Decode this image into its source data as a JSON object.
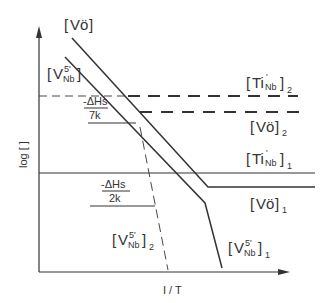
{
  "diagram": {
    "title": "",
    "axes": {
      "x_label": "I / T",
      "y_label": "log [ ]"
    },
    "curves": [
      {
        "id": "vo",
        "label": "[Vö]",
        "position": "top",
        "style": "solid"
      },
      {
        "id": "vnb5",
        "label": "[V5'Nb]",
        "position": "top-left",
        "style": "solid"
      },
      {
        "id": "tinb2",
        "label": "[Ti'Nb]2",
        "style": "dashed-thick"
      },
      {
        "id": "vo2",
        "label": "[Vö]2",
        "style": "dashed-thick"
      },
      {
        "id": "tinb1",
        "label": "[Ti'Nb]1",
        "style": "solid"
      },
      {
        "id": "vo1",
        "label": "[Vö]1",
        "style": "solid"
      },
      {
        "id": "vnb5_2",
        "label": "[V5'Nb]2",
        "style": "dashed-thin"
      },
      {
        "id": "vnb5_1",
        "label": "[V5'Nb]1",
        "style": "solid"
      }
    ],
    "slopes": [
      {
        "numerator": "-ΔHs",
        "denominator": "7k"
      },
      {
        "numerator": "-ΔHs",
        "denominator": "2k"
      }
    ]
  },
  "text": {
    "vo_letter": "V",
    "o_letter": "ö",
    "v_letter": "V",
    "sup5": "5'",
    "sub_nb": "Nb",
    "ti": "Ti",
    "prime": "'",
    "sub1": "1",
    "sub2": "2",
    "xlabel": "I / T",
    "ylabel": "log [ ]",
    "slope1_num": "-ΔHs",
    "slope1_den": "7k",
    "slope2_num": "-ΔHs",
    "slope2_den": "2k",
    "lb": "[",
    "rb": "]"
  }
}
